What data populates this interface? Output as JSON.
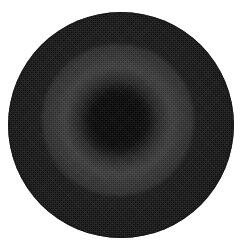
{
  "image": {
    "title": "Grayscale circular disk with dark central core",
    "width": 246,
    "height": 252,
    "background_color": "#ffffff",
    "alt_text": "A filled circle rendered in dark grayscale on a white background, with a very dark near-black core slightly above and left of center, surrounded by a faint lighter halo ring and a uniform dark gray annulus that darkens again at the outer rim."
  },
  "disk": {
    "name": "disk",
    "center_x": 121,
    "center_y": 125,
    "radius": 113,
    "diameter": 226,
    "bounds": {
      "left": 8,
      "top": 12,
      "right": 234,
      "bottom": 238
    },
    "base_color": "#2c2c2c",
    "rim_color": "#141414",
    "edge_sharpness": "hard"
  },
  "core": {
    "name": "dark-core",
    "center_x": 118,
    "center_y": 120,
    "solid_radius": 32,
    "falloff_radius": 58,
    "color": "#000000",
    "description": "Near-black central region with a smooth radial falloff into the surrounding gray."
  },
  "halo_ring": {
    "name": "halo-ring",
    "center_x": 118,
    "center_y": 120,
    "inner_radius": 60,
    "outer_radius": 86,
    "color": "#343434",
    "description": "Faint brighter annulus encircling the dark core."
  },
  "vignette": {
    "name": "rim-vignette",
    "start_radius": 88,
    "end_radius": 113,
    "color": "#121212",
    "description": "Gradual darkening from the mid annulus toward the outer rim."
  },
  "texture": {
    "name": "dither-noise",
    "type": "checkerboard-dither",
    "visible": true,
    "description": "Fine pixel-level dithering / sensor noise texture visible across the mid-gray tones."
  },
  "tonal_profile": {
    "type": "radial",
    "label": "Gray level vs. radius from core",
    "radii": [
      0,
      16,
      32,
      44,
      58,
      72,
      86,
      100,
      108,
      113
    ],
    "gray_values": [
      0,
      0,
      4,
      16,
      34,
      46,
      52,
      44,
      28,
      14
    ],
    "note": "8-bit gray levels sampled outward from the dark core center."
  }
}
